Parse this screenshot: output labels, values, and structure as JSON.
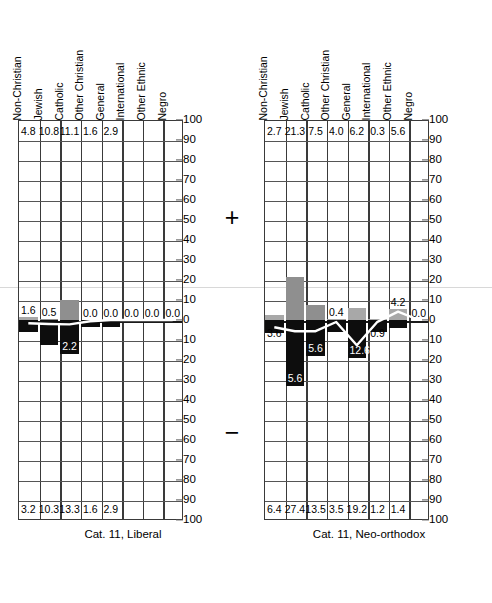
{
  "chart_data": [
    {
      "type": "bar",
      "title": "Cat. 11, Liberal",
      "panel": "left",
      "categories": [
        "Non-Christian",
        "Jewish",
        "Catholic",
        "Other Christian",
        "General",
        "International",
        "Other Ethnic",
        "Negro"
      ],
      "top_row_values": [
        "4.8",
        "10.8",
        "11.1",
        "1.6",
        "2.9",
        "",
        "",
        ""
      ],
      "bottom_row_values": [
        "3.2",
        "10.3",
        "13.3",
        "1.6",
        "2.9",
        "",
        "",
        ""
      ],
      "positive_bars": [
        1.6,
        0.5,
        10.0,
        0.0,
        0.0,
        0.0,
        0.0,
        0.0
      ],
      "negative_bars": [
        6.0,
        12.5,
        17.0,
        3.5,
        3.5,
        0.0,
        0.0,
        0.0
      ],
      "bar_labels": [
        "1.6",
        "0.5",
        "",
        "0.0",
        "0.0",
        "0.0",
        "0.0",
        "0.0"
      ],
      "negative_bar_labels": [
        "",
        "",
        "2.2",
        "",
        "",
        "",
        "",
        ""
      ],
      "line_values": [
        -1.6,
        -2.0,
        -2.2,
        -0.6,
        0.0,
        0.0,
        0.0,
        0.0
      ],
      "ylabel": "",
      "xlabel": "",
      "ylim_positive": [
        0,
        100
      ],
      "ylim_negative": [
        0,
        100
      ],
      "yticks_positive": [
        "100",
        "90",
        "80",
        "70",
        "60",
        "50",
        "40",
        "30",
        "20",
        "10",
        "0"
      ],
      "yticks_negative": [
        "10",
        "20",
        "30",
        "40",
        "50",
        "60",
        "70",
        "80",
        "90",
        "100"
      ],
      "grid": true
    },
    {
      "type": "bar",
      "title": "Cat. 11, Neo-orthodox",
      "panel": "right",
      "categories": [
        "Non-Christian",
        "Jewish",
        "Catholic",
        "Other Christian",
        "General",
        "International",
        "Other Ethnic",
        "Negro"
      ],
      "top_row_values": [
        "2.7",
        "21.3",
        "7.5",
        "4.0",
        "6.2",
        "0.3",
        "5.6",
        ""
      ],
      "bottom_row_values": [
        "6.4",
        "27.4",
        "13.5",
        "3.5",
        "19.2",
        "1.2",
        "1.4",
        ""
      ],
      "positive_bars": [
        2.7,
        21.3,
        7.5,
        0.4,
        6.2,
        0.3,
        5.6,
        0.0
      ],
      "negative_bars": [
        6.4,
        33.0,
        18.0,
        6.0,
        19.2,
        6.0,
        4.0,
        0.0
      ],
      "bar_labels": [
        "",
        "",
        "",
        "0.4",
        "",
        "",
        "4.2",
        "0.0"
      ],
      "negative_bar_labels": [
        "3.6",
        "5.6",
        "5.6",
        "",
        "12.6",
        "0.9",
        "",
        ""
      ],
      "line_values": [
        -3.6,
        -5.6,
        -5.6,
        -1.0,
        -12.6,
        -0.9,
        4.2,
        0.0
      ],
      "ylabel": "",
      "xlabel": "",
      "ylim_positive": [
        0,
        100
      ],
      "ylim_negative": [
        0,
        100
      ],
      "yticks_positive": [
        "100",
        "90",
        "80",
        "70",
        "60",
        "50",
        "40",
        "30",
        "20",
        "10",
        "0"
      ],
      "yticks_negative": [
        "10",
        "20",
        "30",
        "40",
        "50",
        "60",
        "70",
        "80",
        "90",
        "100"
      ],
      "grid": true
    }
  ],
  "signs": {
    "plus": "+",
    "minus": "−"
  },
  "left": {
    "caption": "Cat. 11, Liberal",
    "headers": [
      "Non-Christian",
      "Jewish",
      "Catholic",
      "Other Christian",
      "General",
      "International",
      "Other Ethnic",
      "Negro"
    ],
    "top_values": [
      "4.8",
      "10.8",
      "11.1",
      "1.6",
      "2.9",
      "",
      "",
      ""
    ],
    "bottom_values": [
      "3.2",
      "10.3",
      "13.3",
      "1.6",
      "2.9",
      "",
      "",
      ""
    ],
    "bar_labels": [
      "1.6",
      "0.5",
      "2.2",
      "0.0",
      "0.0",
      "0.0",
      "0.0",
      "0.0"
    ],
    "yticks_top": [
      "100",
      "90",
      "80",
      "70",
      "60",
      "50",
      "40",
      "30",
      "20",
      "10",
      "0"
    ],
    "yticks_bottom": [
      "10",
      "20",
      "30",
      "40",
      "50",
      "60",
      "70",
      "80",
      "90",
      "100"
    ]
  },
  "right": {
    "caption": "Cat. 11, Neo-orthodox",
    "headers": [
      "Non-Christian",
      "Jewish",
      "Catholic",
      "Other Christian",
      "General",
      "International",
      "Other Ethnic",
      "Negro"
    ],
    "top_values": [
      "2.7",
      "21.3",
      "7.5",
      "4.0",
      "6.2",
      "0.3",
      "5.6",
      ""
    ],
    "bottom_values": [
      "6.4",
      "27.4",
      "13.5",
      "3.5",
      "19.2",
      "1.2",
      "1.4",
      ""
    ],
    "bar_labels": [
      "3.6",
      "5.6",
      "5.6",
      "0.4",
      "12.6",
      "0.9",
      "4.2",
      "0.0"
    ],
    "yticks_top": [
      "100",
      "90",
      "80",
      "70",
      "60",
      "50",
      "40",
      "30",
      "20",
      "10",
      "0"
    ],
    "yticks_bottom": [
      "10",
      "20",
      "30",
      "40",
      "50",
      "60",
      "70",
      "80",
      "90",
      "100"
    ]
  }
}
